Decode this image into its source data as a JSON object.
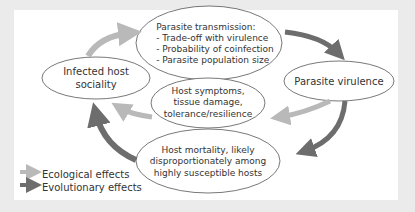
{
  "diagram": {
    "nodes": [
      {
        "id": "infected-host-sociality",
        "lines": [
          "Infected host",
          "sociality"
        ]
      },
      {
        "id": "parasite-transmission",
        "lines": [
          "Parasite transmission:",
          "- Trade-off with virulence",
          "- Probability of coinfection",
          "- Parasite population size"
        ]
      },
      {
        "id": "parasite-virulence",
        "lines": [
          "Parasite virulence"
        ]
      },
      {
        "id": "host-symptoms",
        "lines": [
          "Host symptoms,",
          "tissue damage,",
          "tolerance/resilience"
        ]
      },
      {
        "id": "host-mortality",
        "lines": [
          "Host mortality, likely",
          "disproportionately among",
          "highly susceptible hosts"
        ]
      }
    ],
    "edges": [
      {
        "from": "infected-host-sociality",
        "to": "parasite-transmission",
        "type": "ecological"
      },
      {
        "from": "parasite-transmission",
        "to": "parasite-virulence",
        "type": "evolutionary"
      },
      {
        "from": "parasite-virulence",
        "to": "host-symptoms",
        "type": "ecological"
      },
      {
        "from": "host-symptoms",
        "to": "infected-host-sociality",
        "type": "ecological"
      },
      {
        "from": "parasite-virulence",
        "to": "host-mortality",
        "type": "evolutionary"
      },
      {
        "from": "host-mortality",
        "to": "infected-host-sociality",
        "type": "evolutionary"
      }
    ],
    "legend": [
      {
        "label": "Ecological effects",
        "color": "#b9b9b9"
      },
      {
        "label": "Evolutionary effects",
        "color": "#6d6d6d"
      }
    ],
    "colors": {
      "ecological": "#b9b9b9",
      "evolutionary": "#6d6d6d",
      "outline": "#555555",
      "background": "#ebebeb",
      "panel": "#ffffff"
    }
  }
}
